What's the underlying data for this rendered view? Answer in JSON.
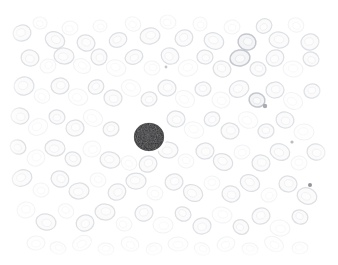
{
  "image": {
    "kind": "light-microscopy-photomicrograph",
    "subject": "peripheral blood smear",
    "stain": "Romanowsky / Wright-Giemsa (very pale)",
    "width_px": 338,
    "height_px": 265,
    "background_color": "#ffffff",
    "border_style": "white faded vignette on all four edges",
    "alt_text": "Pale photomicrograph of a blood smear: many faint gray-outlined red blood cells fill the field, with one small dark-stained nucleated white blood cell slightly left of centre."
  },
  "palette": {
    "background": "#ffffff",
    "rbc_outline": "#d6d8dd",
    "rbc_outline_dark": "#c2c5cc",
    "rbc_outline_faint": "#e7e9ec",
    "rbc_fill": "#f4f5f7",
    "rbc_fill_pale": "#fafbfc",
    "nucleus_dark": "#1c1c1e",
    "nucleus_mid": "#2e2e32",
    "nucleus_edge": "#4a4a50",
    "speck": "#8e9097"
  },
  "features": {
    "white_blood_cell": {
      "label": "dark-stained nucleated cell (lymphocyte)",
      "center_x": 149,
      "center_y": 137,
      "radius_x": 15,
      "radius_y": 14,
      "fill": "#1c1c1e",
      "texture": "mottled chromatin"
    },
    "specks": [
      {
        "label": "dark speck right-lower",
        "x": 310,
        "y": 185,
        "r": 2.0,
        "color": "#7f8188"
      },
      {
        "label": "dark speck upper-right",
        "x": 265,
        "y": 106,
        "r": 2.2,
        "color": "#9a9ca2"
      },
      {
        "label": "faint speck centre-top",
        "x": 166,
        "y": 67,
        "r": 1.4,
        "color": "#b9bbc0"
      },
      {
        "label": "faint speck right-edge",
        "x": 292,
        "y": 142,
        "r": 1.6,
        "color": "#b0b2b8"
      }
    ],
    "red_blood_cells": [
      {
        "x": 22,
        "y": 33,
        "rx": 9,
        "ry": 8,
        "rot": -15,
        "tone": "mid"
      },
      {
        "x": 40,
        "y": 23,
        "rx": 7,
        "ry": 6,
        "rot": 10,
        "tone": "faint"
      },
      {
        "x": 55,
        "y": 40,
        "rx": 10,
        "ry": 8,
        "rot": 25,
        "tone": "mid"
      },
      {
        "x": 70,
        "y": 28,
        "rx": 8,
        "ry": 7,
        "rot": -5,
        "tone": "faint"
      },
      {
        "x": 86,
        "y": 43,
        "rx": 9,
        "ry": 8,
        "rot": 18,
        "tone": "mid"
      },
      {
        "x": 100,
        "y": 26,
        "rx": 7,
        "ry": 6,
        "rot": 0,
        "tone": "faint"
      },
      {
        "x": 118,
        "y": 40,
        "rx": 9,
        "ry": 7,
        "rot": -20,
        "tone": "mid"
      },
      {
        "x": 133,
        "y": 24,
        "rx": 8,
        "ry": 7,
        "rot": 30,
        "tone": "faint"
      },
      {
        "x": 150,
        "y": 36,
        "rx": 10,
        "ry": 8,
        "rot": -10,
        "tone": "mid"
      },
      {
        "x": 168,
        "y": 22,
        "rx": 8,
        "ry": 7,
        "rot": 12,
        "tone": "faint"
      },
      {
        "x": 184,
        "y": 38,
        "rx": 9,
        "ry": 8,
        "rot": -25,
        "tone": "mid"
      },
      {
        "x": 200,
        "y": 24,
        "rx": 7,
        "ry": 7,
        "rot": 5,
        "tone": "faint"
      },
      {
        "x": 214,
        "y": 41,
        "rx": 10,
        "ry": 8,
        "rot": 20,
        "tone": "mid"
      },
      {
        "x": 232,
        "y": 27,
        "rx": 8,
        "ry": 7,
        "rot": -8,
        "tone": "faint"
      },
      {
        "x": 247,
        "y": 42,
        "rx": 9,
        "ry": 8,
        "rot": 15,
        "tone": "dark"
      },
      {
        "x": 264,
        "y": 26,
        "rx": 8,
        "ry": 7,
        "rot": -30,
        "tone": "mid"
      },
      {
        "x": 279,
        "y": 40,
        "rx": 10,
        "ry": 8,
        "rot": 8,
        "tone": "mid"
      },
      {
        "x": 296,
        "y": 25,
        "rx": 8,
        "ry": 7,
        "rot": 22,
        "tone": "faint"
      },
      {
        "x": 310,
        "y": 42,
        "rx": 9,
        "ry": 8,
        "rot": -12,
        "tone": "mid"
      },
      {
        "x": 30,
        "y": 58,
        "rx": 9,
        "ry": 8,
        "rot": 14,
        "tone": "mid"
      },
      {
        "x": 48,
        "y": 66,
        "rx": 8,
        "ry": 7,
        "rot": -18,
        "tone": "faint"
      },
      {
        "x": 64,
        "y": 56,
        "rx": 10,
        "ry": 8,
        "rot": 4,
        "tone": "mid"
      },
      {
        "x": 82,
        "y": 66,
        "rx": 9,
        "ry": 7,
        "rot": 28,
        "tone": "faint"
      },
      {
        "x": 99,
        "y": 57,
        "rx": 8,
        "ry": 8,
        "rot": -6,
        "tone": "mid"
      },
      {
        "x": 116,
        "y": 68,
        "rx": 10,
        "ry": 8,
        "rot": 16,
        "tone": "faint"
      },
      {
        "x": 134,
        "y": 57,
        "rx": 9,
        "ry": 7,
        "rot": -22,
        "tone": "mid"
      },
      {
        "x": 152,
        "y": 68,
        "rx": 8,
        "ry": 7,
        "rot": 9,
        "tone": "faint"
      },
      {
        "x": 170,
        "y": 56,
        "rx": 9,
        "ry": 8,
        "rot": 24,
        "tone": "mid"
      },
      {
        "x": 188,
        "y": 68,
        "rx": 10,
        "ry": 8,
        "rot": -14,
        "tone": "faint"
      },
      {
        "x": 205,
        "y": 57,
        "rx": 8,
        "ry": 7,
        "rot": 2,
        "tone": "mid"
      },
      {
        "x": 222,
        "y": 69,
        "rx": 9,
        "ry": 8,
        "rot": 20,
        "tone": "mid"
      },
      {
        "x": 240,
        "y": 58,
        "rx": 10,
        "ry": 8,
        "rot": -9,
        "tone": "dark"
      },
      {
        "x": 258,
        "y": 69,
        "rx": 8,
        "ry": 7,
        "rot": 13,
        "tone": "mid"
      },
      {
        "x": 275,
        "y": 58,
        "rx": 9,
        "ry": 8,
        "rot": -26,
        "tone": "mid"
      },
      {
        "x": 293,
        "y": 69,
        "rx": 10,
        "ry": 8,
        "rot": 6,
        "tone": "faint"
      },
      {
        "x": 311,
        "y": 59,
        "rx": 8,
        "ry": 7,
        "rot": 19,
        "tone": "mid"
      },
      {
        "x": 24,
        "y": 86,
        "rx": 10,
        "ry": 9,
        "rot": -11,
        "tone": "mid"
      },
      {
        "x": 42,
        "y": 96,
        "rx": 8,
        "ry": 7,
        "rot": 21,
        "tone": "faint"
      },
      {
        "x": 60,
        "y": 86,
        "rx": 9,
        "ry": 8,
        "rot": -3,
        "tone": "mid"
      },
      {
        "x": 78,
        "y": 97,
        "rx": 10,
        "ry": 8,
        "rot": 17,
        "tone": "faint"
      },
      {
        "x": 96,
        "y": 87,
        "rx": 8,
        "ry": 7,
        "rot": -28,
        "tone": "mid"
      },
      {
        "x": 113,
        "y": 98,
        "rx": 9,
        "ry": 8,
        "rot": 7,
        "tone": "mid"
      },
      {
        "x": 131,
        "y": 88,
        "rx": 10,
        "ry": 8,
        "rot": 23,
        "tone": "faint"
      },
      {
        "x": 149,
        "y": 99,
        "rx": 8,
        "ry": 7,
        "rot": -16,
        "tone": "mid"
      },
      {
        "x": 167,
        "y": 88,
        "rx": 9,
        "ry": 8,
        "rot": 1,
        "tone": "mid"
      },
      {
        "x": 185,
        "y": 99,
        "rx": 10,
        "ry": 8,
        "rot": 26,
        "tone": "faint"
      },
      {
        "x": 203,
        "y": 89,
        "rx": 8,
        "ry": 7,
        "rot": -7,
        "tone": "mid"
      },
      {
        "x": 221,
        "y": 100,
        "rx": 9,
        "ry": 8,
        "rot": 11,
        "tone": "faint"
      },
      {
        "x": 239,
        "y": 89,
        "rx": 10,
        "ry": 8,
        "rot": -21,
        "tone": "mid"
      },
      {
        "x": 257,
        "y": 100,
        "rx": 8,
        "ry": 7,
        "rot": 15,
        "tone": "dark"
      },
      {
        "x": 275,
        "y": 90,
        "rx": 9,
        "ry": 8,
        "rot": -2,
        "tone": "mid"
      },
      {
        "x": 293,
        "y": 101,
        "rx": 10,
        "ry": 8,
        "rot": 29,
        "tone": "faint"
      },
      {
        "x": 312,
        "y": 91,
        "rx": 8,
        "ry": 7,
        "rot": -13,
        "tone": "mid"
      },
      {
        "x": 20,
        "y": 116,
        "rx": 9,
        "ry": 8,
        "rot": 8,
        "tone": "mid"
      },
      {
        "x": 38,
        "y": 127,
        "rx": 10,
        "ry": 8,
        "rot": -24,
        "tone": "faint"
      },
      {
        "x": 57,
        "y": 117,
        "rx": 8,
        "ry": 7,
        "rot": 12,
        "tone": "mid"
      },
      {
        "x": 75,
        "y": 128,
        "rx": 9,
        "ry": 8,
        "rot": -5,
        "tone": "mid"
      },
      {
        "x": 93,
        "y": 118,
        "rx": 10,
        "ry": 8,
        "rot": 27,
        "tone": "faint"
      },
      {
        "x": 111,
        "y": 129,
        "rx": 8,
        "ry": 7,
        "rot": -17,
        "tone": "mid"
      },
      {
        "x": 176,
        "y": 119,
        "rx": 9,
        "ry": 8,
        "rot": 3,
        "tone": "mid"
      },
      {
        "x": 194,
        "y": 130,
        "rx": 10,
        "ry": 8,
        "rot": 18,
        "tone": "faint"
      },
      {
        "x": 212,
        "y": 119,
        "rx": 8,
        "ry": 7,
        "rot": -27,
        "tone": "mid"
      },
      {
        "x": 230,
        "y": 131,
        "rx": 9,
        "ry": 8,
        "rot": 6,
        "tone": "mid"
      },
      {
        "x": 248,
        "y": 120,
        "rx": 10,
        "ry": 8,
        "rot": 22,
        "tone": "faint"
      },
      {
        "x": 266,
        "y": 131,
        "rx": 8,
        "ry": 7,
        "rot": -10,
        "tone": "mid"
      },
      {
        "x": 285,
        "y": 120,
        "rx": 9,
        "ry": 8,
        "rot": 14,
        "tone": "mid"
      },
      {
        "x": 304,
        "y": 132,
        "rx": 10,
        "ry": 8,
        "rot": -1,
        "tone": "faint"
      },
      {
        "x": 18,
        "y": 147,
        "rx": 8,
        "ry": 7,
        "rot": 25,
        "tone": "mid"
      },
      {
        "x": 36,
        "y": 158,
        "rx": 9,
        "ry": 8,
        "rot": -19,
        "tone": "faint"
      },
      {
        "x": 55,
        "y": 148,
        "rx": 10,
        "ry": 8,
        "rot": 4,
        "tone": "mid"
      },
      {
        "x": 73,
        "y": 159,
        "rx": 8,
        "ry": 7,
        "rot": 20,
        "tone": "mid"
      },
      {
        "x": 92,
        "y": 149,
        "rx": 9,
        "ry": 8,
        "rot": -12,
        "tone": "faint"
      },
      {
        "x": 110,
        "y": 160,
        "rx": 10,
        "ry": 8,
        "rot": 9,
        "tone": "mid"
      },
      {
        "x": 129,
        "y": 163,
        "rx": 8,
        "ry": 7,
        "rot": 30,
        "tone": "faint"
      },
      {
        "x": 148,
        "y": 164,
        "rx": 9,
        "ry": 8,
        "rot": -23,
        "tone": "mid"
      },
      {
        "x": 168,
        "y": 150,
        "rx": 10,
        "ry": 8,
        "rot": 2,
        "tone": "mid"
      },
      {
        "x": 186,
        "y": 161,
        "rx": 8,
        "ry": 7,
        "rot": 16,
        "tone": "faint"
      },
      {
        "x": 205,
        "y": 151,
        "rx": 9,
        "ry": 8,
        "rot": -6,
        "tone": "mid"
      },
      {
        "x": 223,
        "y": 162,
        "rx": 10,
        "ry": 8,
        "rot": 24,
        "tone": "mid"
      },
      {
        "x": 242,
        "y": 152,
        "rx": 8,
        "ry": 7,
        "rot": -15,
        "tone": "faint"
      },
      {
        "x": 261,
        "y": 163,
        "rx": 9,
        "ry": 8,
        "rot": 5,
        "tone": "mid"
      },
      {
        "x": 280,
        "y": 152,
        "rx": 10,
        "ry": 8,
        "rot": 21,
        "tone": "mid"
      },
      {
        "x": 299,
        "y": 163,
        "rx": 8,
        "ry": 7,
        "rot": -8,
        "tone": "faint"
      },
      {
        "x": 316,
        "y": 152,
        "rx": 9,
        "ry": 8,
        "rot": 13,
        "tone": "mid"
      },
      {
        "x": 22,
        "y": 178,
        "rx": 10,
        "ry": 8,
        "rot": -20,
        "tone": "mid"
      },
      {
        "x": 41,
        "y": 190,
        "rx": 8,
        "ry": 7,
        "rot": 7,
        "tone": "faint"
      },
      {
        "x": 60,
        "y": 179,
        "rx": 9,
        "ry": 8,
        "rot": 23,
        "tone": "mid"
      },
      {
        "x": 79,
        "y": 191,
        "rx": 10,
        "ry": 8,
        "rot": -4,
        "tone": "mid"
      },
      {
        "x": 98,
        "y": 180,
        "rx": 8,
        "ry": 7,
        "rot": 18,
        "tone": "faint"
      },
      {
        "x": 117,
        "y": 192,
        "rx": 9,
        "ry": 8,
        "rot": -26,
        "tone": "mid"
      },
      {
        "x": 136,
        "y": 181,
        "rx": 10,
        "ry": 8,
        "rot": 0,
        "tone": "mid"
      },
      {
        "x": 155,
        "y": 193,
        "rx": 8,
        "ry": 7,
        "rot": 15,
        "tone": "faint"
      },
      {
        "x": 174,
        "y": 182,
        "rx": 9,
        "ry": 8,
        "rot": -11,
        "tone": "mid"
      },
      {
        "x": 193,
        "y": 193,
        "rx": 10,
        "ry": 8,
        "rot": 28,
        "tone": "mid"
      },
      {
        "x": 212,
        "y": 183,
        "rx": 8,
        "ry": 7,
        "rot": -2,
        "tone": "faint"
      },
      {
        "x": 231,
        "y": 194,
        "rx": 9,
        "ry": 8,
        "rot": 10,
        "tone": "mid"
      },
      {
        "x": 250,
        "y": 183,
        "rx": 10,
        "ry": 8,
        "rot": 26,
        "tone": "mid"
      },
      {
        "x": 269,
        "y": 195,
        "rx": 8,
        "ry": 7,
        "rot": -18,
        "tone": "faint"
      },
      {
        "x": 288,
        "y": 184,
        "rx": 9,
        "ry": 8,
        "rot": 3,
        "tone": "mid"
      },
      {
        "x": 307,
        "y": 196,
        "rx": 10,
        "ry": 8,
        "rot": 19,
        "tone": "mid"
      },
      {
        "x": 26,
        "y": 210,
        "rx": 9,
        "ry": 8,
        "rot": -9,
        "tone": "faint"
      },
      {
        "x": 46,
        "y": 222,
        "rx": 10,
        "ry": 8,
        "rot": 12,
        "tone": "mid"
      },
      {
        "x": 66,
        "y": 211,
        "rx": 8,
        "ry": 7,
        "rot": 27,
        "tone": "faint"
      },
      {
        "x": 85,
        "y": 223,
        "rx": 9,
        "ry": 8,
        "rot": -22,
        "tone": "mid"
      },
      {
        "x": 105,
        "y": 212,
        "rx": 10,
        "ry": 8,
        "rot": 5,
        "tone": "mid"
      },
      {
        "x": 124,
        "y": 224,
        "rx": 8,
        "ry": 7,
        "rot": 17,
        "tone": "faint"
      },
      {
        "x": 144,
        "y": 213,
        "rx": 9,
        "ry": 8,
        "rot": -13,
        "tone": "mid"
      },
      {
        "x": 163,
        "y": 225,
        "rx": 10,
        "ry": 8,
        "rot": 1,
        "tone": "faint"
      },
      {
        "x": 183,
        "y": 214,
        "rx": 8,
        "ry": 7,
        "rot": 24,
        "tone": "mid"
      },
      {
        "x": 202,
        "y": 226,
        "rx": 9,
        "ry": 8,
        "rot": -7,
        "tone": "mid"
      },
      {
        "x": 222,
        "y": 215,
        "rx": 10,
        "ry": 8,
        "rot": 11,
        "tone": "faint"
      },
      {
        "x": 241,
        "y": 227,
        "rx": 8,
        "ry": 7,
        "rot": 29,
        "tone": "mid"
      },
      {
        "x": 261,
        "y": 216,
        "rx": 9,
        "ry": 8,
        "rot": -16,
        "tone": "mid"
      },
      {
        "x": 280,
        "y": 228,
        "rx": 10,
        "ry": 8,
        "rot": 8,
        "tone": "faint"
      },
      {
        "x": 300,
        "y": 217,
        "rx": 8,
        "ry": 7,
        "rot": 21,
        "tone": "mid"
      },
      {
        "x": 36,
        "y": 243,
        "rx": 9,
        "ry": 7,
        "rot": -5,
        "tone": "faint"
      },
      {
        "x": 58,
        "y": 248,
        "rx": 8,
        "ry": 6,
        "rot": 14,
        "tone": "faint"
      },
      {
        "x": 82,
        "y": 243,
        "rx": 10,
        "ry": 7,
        "rot": -25,
        "tone": "faint"
      },
      {
        "x": 106,
        "y": 249,
        "rx": 8,
        "ry": 6,
        "rot": 6,
        "tone": "faint"
      },
      {
        "x": 130,
        "y": 244,
        "rx": 9,
        "ry": 7,
        "rot": 20,
        "tone": "faint"
      },
      {
        "x": 154,
        "y": 249,
        "rx": 8,
        "ry": 6,
        "rot": -10,
        "tone": "faint"
      },
      {
        "x": 178,
        "y": 244,
        "rx": 10,
        "ry": 7,
        "rot": 2,
        "tone": "faint"
      },
      {
        "x": 202,
        "y": 249,
        "rx": 8,
        "ry": 6,
        "rot": 23,
        "tone": "faint"
      },
      {
        "x": 226,
        "y": 244,
        "rx": 9,
        "ry": 7,
        "rot": -17,
        "tone": "faint"
      },
      {
        "x": 250,
        "y": 249,
        "rx": 8,
        "ry": 6,
        "rot": 9,
        "tone": "faint"
      },
      {
        "x": 274,
        "y": 244,
        "rx": 10,
        "ry": 7,
        "rot": 26,
        "tone": "faint"
      },
      {
        "x": 300,
        "y": 248,
        "rx": 8,
        "ry": 6,
        "rot": -3,
        "tone": "faint"
      }
    ]
  }
}
